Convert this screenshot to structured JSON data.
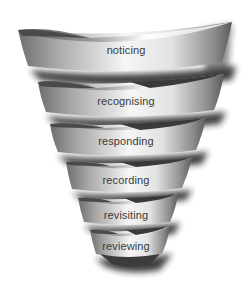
{
  "diagram": {
    "type": "funnel",
    "style": "3d-grayscale-spiral-bands",
    "stages": [
      {
        "label": "noticing"
      },
      {
        "label": "recognising"
      },
      {
        "label": "responding"
      },
      {
        "label": "recording"
      },
      {
        "label": "revisiting"
      },
      {
        "label": "reviewing"
      }
    ],
    "colors": {
      "background": "#ffffff",
      "band_light": "#f4f4f4",
      "band_dark": "#6a6a6a",
      "shadow": "#1e1e1e",
      "text": "#3a3a3a"
    }
  }
}
